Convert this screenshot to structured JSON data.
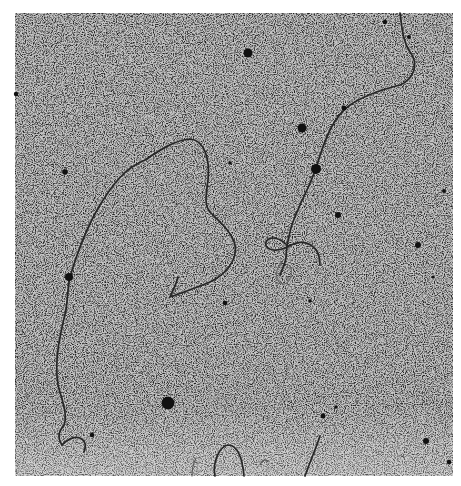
{
  "image": {
    "kind": "electron micrograph",
    "subject": "filamentous strands with dark particles on grainy background",
    "colors": {
      "background": "#ffffff",
      "field": "#bdbdbd",
      "grain_dark": "#2a2a2a",
      "strand": "#2b2b2b",
      "particle": "#111111"
    },
    "bounds": {
      "x": 15,
      "y": 13,
      "width": 438,
      "height": 463
    }
  }
}
